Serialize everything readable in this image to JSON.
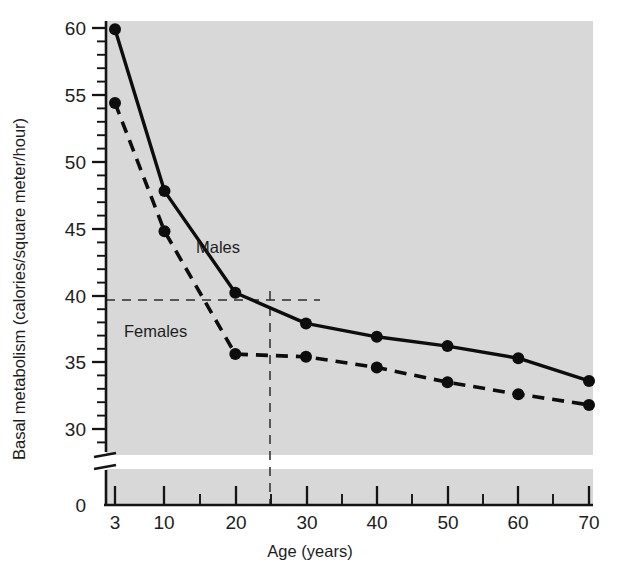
{
  "chart_data": {
    "type": "line",
    "title": "",
    "xlabel": "Age (years)",
    "ylabel": "Basal metabolism (calories/square meter/hour)",
    "x": [
      3,
      10,
      20,
      30,
      40,
      50,
      60,
      70
    ],
    "xtick_labels": [
      "3",
      "10",
      "20",
      "30",
      "40",
      "50",
      "60",
      "70"
    ],
    "xtick_values": [
      3,
      10,
      20,
      30,
      40,
      50,
      60,
      70
    ],
    "xlim": [
      0,
      73
    ],
    "ytick_labels": [
      "0",
      "30",
      "35",
      "40",
      "45",
      "50",
      "55",
      "60"
    ],
    "ytick_values": [
      0,
      30,
      35,
      40,
      45,
      50,
      55,
      60
    ],
    "ylim": [
      28,
      61
    ],
    "y_axis_break": true,
    "y_axis_break_note": "axis broken between 0 and ~28",
    "grid": false,
    "legend_position": "inline-annotation",
    "series": [
      {
        "name": "Males",
        "style": "solid",
        "values": [
          59.9,
          47.8,
          40.2,
          37.9,
          36.9,
          36.2,
          35.3,
          33.6
        ]
      },
      {
        "name": "Females",
        "style": "dashed",
        "values": [
          54.4,
          44.8,
          35.6,
          35.4,
          34.6,
          33.5,
          32.6,
          31.8
        ]
      }
    ],
    "annotations": [
      {
        "text": "Males",
        "x": 21.5,
        "y": 43.0
      },
      {
        "text": "Females",
        "x": 10.5,
        "y": 37.3
      }
    ],
    "reference_lines": [
      {
        "orientation": "horizontal",
        "value": 39.2,
        "style": "dashed"
      },
      {
        "orientation": "vertical",
        "value": 24.0,
        "style": "dashed"
      }
    ]
  },
  "colors": {
    "plot_background": "#d8d8d8",
    "page_background": "#ffffff",
    "ink": "#0d0d0d"
  }
}
